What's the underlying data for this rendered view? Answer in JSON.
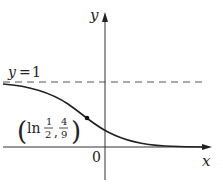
{
  "figure": {
    "type": "function-graph",
    "axes": {
      "x_label": "x",
      "y_label": "y",
      "origin_label": "0"
    },
    "asymptote": {
      "label_var": "y",
      "label_eq": "=",
      "label_val": "1",
      "style": "dashed"
    },
    "marked_point": {
      "label_open": "(",
      "label_fn": "ln",
      "x_num": "1",
      "x_den": "2",
      "comma": ",",
      "y_num": "4",
      "y_den": "9",
      "label_close": ")"
    },
    "colors": {
      "curve": "#222222",
      "axes": "#333333",
      "dashed": "#555555"
    }
  }
}
